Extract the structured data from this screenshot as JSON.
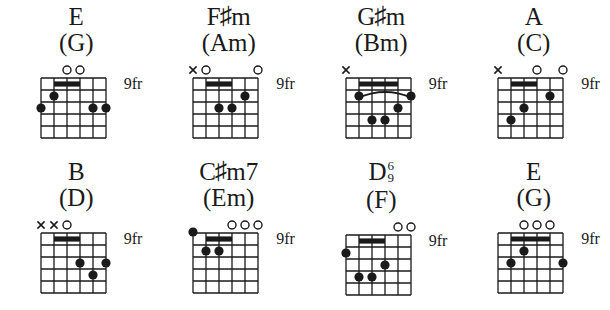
{
  "page": {
    "background_color": "#ffffff",
    "ink_color": "#1a1a1a",
    "strings": 6,
    "frets": 5,
    "fret_label_all": "9fr"
  },
  "chords": [
    {
      "id": "chord-1",
      "name_root": "E",
      "name_accidental": "",
      "name_quality": "",
      "name_ext_upper": "",
      "name_ext_lower": "",
      "name_alt": "(G)",
      "fret_label": "9fr",
      "open_strings": [
        3,
        4
      ],
      "muted_strings": [],
      "above_nut_dots": [],
      "barres": [
        {
          "fret": 1,
          "from_string": 2,
          "to_string": 4
        }
      ],
      "arcs": [],
      "dots": [
        {
          "string": 2,
          "fret": 2
        },
        {
          "string": 1,
          "fret": 3
        },
        {
          "string": 5,
          "fret": 3
        },
        {
          "string": 6,
          "fret": 3
        }
      ]
    },
    {
      "id": "chord-2",
      "name_root": "F",
      "name_accidental": "♯",
      "name_quality": "m",
      "name_ext_upper": "",
      "name_ext_lower": "",
      "name_alt": "(Am)",
      "fret_label": "9fr",
      "open_strings": [
        2,
        6
      ],
      "muted_strings": [
        1
      ],
      "above_nut_dots": [],
      "barres": [
        {
          "fret": 1,
          "from_string": 2,
          "to_string": 4
        }
      ],
      "arcs": [],
      "dots": [
        {
          "string": 5,
          "fret": 2
        },
        {
          "string": 3,
          "fret": 3
        },
        {
          "string": 4,
          "fret": 3
        }
      ]
    },
    {
      "id": "chord-3",
      "name_root": "G",
      "name_accidental": "♯",
      "name_quality": "m",
      "name_ext_upper": "",
      "name_ext_lower": "",
      "name_alt": "(Bm)",
      "fret_label": "9fr",
      "open_strings": [],
      "muted_strings": [
        1
      ],
      "above_nut_dots": [],
      "barres": [
        {
          "fret": 1,
          "from_string": 2,
          "to_string": 5
        }
      ],
      "arcs": [
        {
          "fret": 2,
          "from_string": 2,
          "to_string": 6
        }
      ],
      "dots": [
        {
          "string": 2,
          "fret": 2
        },
        {
          "string": 6,
          "fret": 2
        },
        {
          "string": 5,
          "fret": 3
        },
        {
          "string": 3,
          "fret": 4
        },
        {
          "string": 4,
          "fret": 4
        }
      ]
    },
    {
      "id": "chord-4",
      "name_root": "A",
      "name_accidental": "",
      "name_quality": "",
      "name_ext_upper": "",
      "name_ext_lower": "",
      "name_alt": "(C)",
      "fret_label": "9fr",
      "open_strings": [
        4,
        6
      ],
      "muted_strings": [
        1
      ],
      "above_nut_dots": [],
      "barres": [
        {
          "fret": 1,
          "from_string": 2,
          "to_string": 4
        }
      ],
      "arcs": [],
      "dots": [
        {
          "string": 5,
          "fret": 2
        },
        {
          "string": 3,
          "fret": 3
        },
        {
          "string": 2,
          "fret": 4
        }
      ]
    },
    {
      "id": "chord-5",
      "name_root": "B",
      "name_accidental": "",
      "name_quality": "",
      "name_ext_upper": "",
      "name_ext_lower": "",
      "name_alt": "(D)",
      "fret_label": "9fr",
      "open_strings": [
        3
      ],
      "muted_strings": [
        1,
        2
      ],
      "above_nut_dots": [],
      "barres": [
        {
          "fret": 1,
          "from_string": 2,
          "to_string": 4
        }
      ],
      "arcs": [],
      "dots": [
        {
          "string": 4,
          "fret": 3
        },
        {
          "string": 6,
          "fret": 3
        },
        {
          "string": 5,
          "fret": 4
        }
      ]
    },
    {
      "id": "chord-6",
      "name_root": "C",
      "name_accidental": "♯",
      "name_quality": "m7",
      "name_ext_upper": "",
      "name_ext_lower": "",
      "name_alt": "(Em)",
      "fret_label": "9fr",
      "open_strings": [
        4,
        5,
        6
      ],
      "muted_strings": [],
      "above_nut_dots": [
        1
      ],
      "barres": [
        {
          "fret": 1,
          "from_string": 2,
          "to_string": 4
        }
      ],
      "arcs": [],
      "dots": [
        {
          "string": 2,
          "fret": 2
        },
        {
          "string": 3,
          "fret": 2
        }
      ]
    },
    {
      "id": "chord-7",
      "name_root": "D",
      "name_accidental": "",
      "name_quality": "",
      "name_ext_upper": "6",
      "name_ext_lower": "9",
      "name_alt": "(F)",
      "fret_label": "9fr",
      "open_strings": [
        5,
        6
      ],
      "muted_strings": [],
      "above_nut_dots": [],
      "barres": [
        {
          "fret": 1,
          "from_string": 2,
          "to_string": 4
        }
      ],
      "arcs": [],
      "dots": [
        {
          "string": 1,
          "fret": 2
        },
        {
          "string": 4,
          "fret": 3
        },
        {
          "string": 2,
          "fret": 4
        },
        {
          "string": 3,
          "fret": 4
        }
      ]
    },
    {
      "id": "chord-8",
      "name_root": "E",
      "name_accidental": "",
      "name_quality": "",
      "name_ext_upper": "",
      "name_ext_lower": "",
      "name_alt": "(G)",
      "fret_label": "9fr",
      "open_strings": [
        3,
        4,
        5
      ],
      "muted_strings": [],
      "above_nut_dots": [],
      "barres": [
        {
          "fret": 1,
          "from_string": 2,
          "to_string": 5
        }
      ],
      "arcs": [],
      "dots": [
        {
          "string": 3,
          "fret": 2
        },
        {
          "string": 2,
          "fret": 3
        },
        {
          "string": 6,
          "fret": 3
        }
      ]
    }
  ]
}
